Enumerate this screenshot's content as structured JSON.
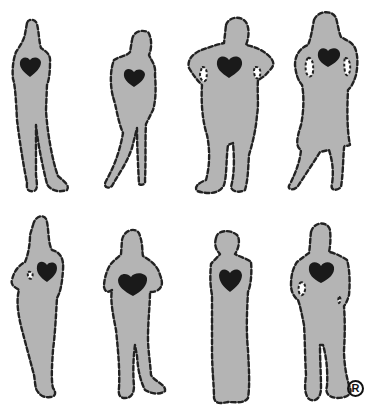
{
  "figure": {
    "rows": 2,
    "columns": 4,
    "figure_count": 8,
    "colors": {
      "background": "#ffffff",
      "silhouette_fill": "#b4b4b4",
      "outline": "#222222",
      "heart": "#1a1a1a"
    }
  },
  "silhouettes": [
    {
      "row": 1,
      "col": 1,
      "pose": "standing, arms at sides, legs crossed"
    },
    {
      "row": 1,
      "col": 2,
      "pose": "leaning, head tilted"
    },
    {
      "row": 1,
      "col": 3,
      "pose": "hands on hips, heavy build"
    },
    {
      "row": 1,
      "col": 4,
      "pose": "woman in skirt, hands on hips"
    },
    {
      "row": 2,
      "col": 1,
      "pose": "arm bent at waist, side profile"
    },
    {
      "row": 2,
      "col": 2,
      "pose": "arms forward, heavy build"
    },
    {
      "row": 2,
      "col": 3,
      "pose": "child-like, straight standing"
    },
    {
      "row": 2,
      "col": 4,
      "pose": "man, hand on hip"
    }
  ],
  "trademark": {
    "symbol": "R",
    "label": "registered-trademark"
  }
}
